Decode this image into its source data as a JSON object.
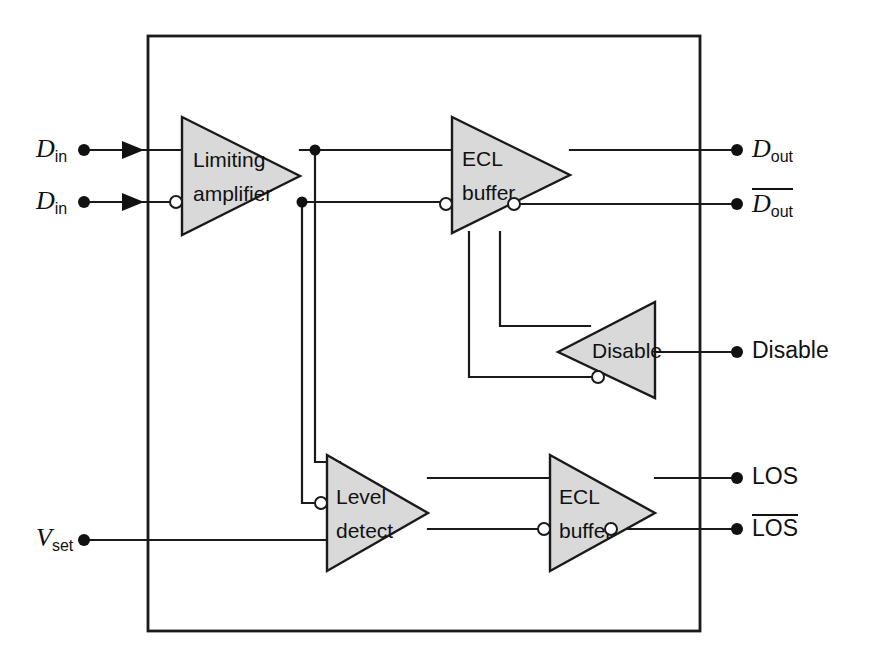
{
  "diagram": {
    "frame": {
      "x": 148,
      "y": 36,
      "width": 552,
      "height": 595
    },
    "colors": {
      "block_fill": "#d9d9d9",
      "line": "#1a1a1a",
      "background": "#ffffff",
      "bubble_fill": "#ffffff"
    },
    "blocks": [
      {
        "id": "limiting-amplifier",
        "label_line1": "Limiting",
        "label_line2": "amplifier",
        "orientation": "right",
        "x": 182,
        "y": 117,
        "w": 118,
        "h": 118
      },
      {
        "id": "ecl-buffer-data",
        "label_line1": "ECL",
        "label_line2": "buffer",
        "orientation": "right",
        "x": 452,
        "y": 117,
        "w": 118,
        "h": 116
      },
      {
        "id": "disable",
        "label_line1": "Disable",
        "label_line2": "",
        "orientation": "left",
        "x": 558,
        "y": 302,
        "w": 97,
        "h": 96
      },
      {
        "id": "level-detect",
        "label_line1": "Level",
        "label_line2": "detect",
        "orientation": "right",
        "x": 327,
        "y": 455,
        "w": 101,
        "h": 116
      },
      {
        "id": "ecl-buffer-los",
        "label_line1": "ECL",
        "label_line2": "buffer",
        "orientation": "right",
        "x": 550,
        "y": 455,
        "w": 105,
        "h": 116
      }
    ],
    "input_pins": [
      {
        "id": "d-in-true",
        "label": "D",
        "sub": "in",
        "overbar": false,
        "x": 36,
        "y": 139,
        "dot_x": 84,
        "wire_y": 150
      },
      {
        "id": "d-in-comp",
        "label": "D",
        "sub": "in",
        "overbar": false,
        "x": 36,
        "y": 191,
        "dot_x": 84,
        "wire_y": 202
      },
      {
        "id": "v-set",
        "label": "V",
        "sub": "set",
        "overbar": false,
        "x": 36,
        "y": 528,
        "dot_x": 84,
        "wire_y": 540
      }
    ],
    "output_pins": [
      {
        "id": "d-out-true",
        "label": "D",
        "sub": "out",
        "overbar": false,
        "x": 752,
        "y": 139,
        "dot_x": 737,
        "wire_y": 150
      },
      {
        "id": "d-out-comp",
        "label": "D",
        "sub": "out",
        "overbar": true,
        "x": 752,
        "y": 191,
        "dot_x": 737,
        "wire_y": 202
      },
      {
        "id": "disable-in",
        "label": "Disable",
        "sub": "",
        "overbar": false,
        "x": 752,
        "y": 341,
        "dot_x": 737,
        "wire_y": 352
      },
      {
        "id": "los-true",
        "label": "LOS",
        "sub": "",
        "overbar": false,
        "x": 752,
        "y": 467,
        "dot_x": 737,
        "wire_y": 478
      },
      {
        "id": "los-comp",
        "label": "LOS",
        "sub": "",
        "overbar": true,
        "x": 752,
        "y": 518,
        "dot_x": 737,
        "wire_y": 529
      }
    ],
    "inversion_bubbles": [
      {
        "id": "bubble-limiting-amp-in",
        "cx": 176,
        "cy": 202,
        "r": 6
      },
      {
        "id": "bubble-ecl-data-in",
        "cx": 446,
        "cy": 204,
        "r": 6
      },
      {
        "id": "bubble-ecl-data-out",
        "cx": 514,
        "cy": 204,
        "r": 6
      },
      {
        "id": "bubble-disable-in",
        "cx": 598,
        "cy": 377,
        "r": 6
      },
      {
        "id": "bubble-level-detect-in",
        "cx": 321,
        "cy": 503,
        "r": 6
      },
      {
        "id": "bubble-ecl-los-in",
        "cx": 544,
        "cy": 529,
        "r": 6
      },
      {
        "id": "bubble-ecl-los-out",
        "cx": 611,
        "cy": 529,
        "r": 6
      }
    ],
    "junction_dots": [
      {
        "id": "junction-data-true",
        "cx": 315,
        "cy": 150,
        "r": 5.5
      },
      {
        "id": "junction-data-comp",
        "cx": 302,
        "cy": 202,
        "r": 5.5
      }
    ],
    "flow_arrows": [
      {
        "id": "arrow-d-in-true",
        "x": 140,
        "y": 150
      },
      {
        "id": "arrow-d-in-comp",
        "x": 140,
        "y": 202
      }
    ]
  }
}
